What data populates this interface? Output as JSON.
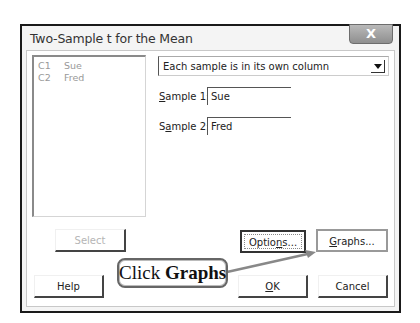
{
  "dialog": {
    "title": "Two-Sample t for the Mean",
    "close_label": "X"
  },
  "variables_list": {
    "items": [
      {
        "id": "C1",
        "name": "Sue"
      },
      {
        "id": "C2",
        "name": "Fred"
      }
    ]
  },
  "data_arrangement": {
    "selected": "Each sample is in its own column"
  },
  "sample1": {
    "label_prefix": "",
    "label_mnemonic": "S",
    "label_rest": "ample 1:",
    "value": "Sue"
  },
  "sample2": {
    "label_prefix": "S",
    "label_mnemonic": "a",
    "label_rest": "mple 2:",
    "value": "Fred"
  },
  "buttons": {
    "select": "Select",
    "options_pre": "Optio",
    "options_mnemonic": "n",
    "options_post": "s...",
    "graphs_mnemonic": "G",
    "graphs_post": "raphs...",
    "help": "Help",
    "ok_mnemonic": "O",
    "ok_post": "K",
    "cancel": "Cancel"
  },
  "annotation": {
    "prefix": "Click ",
    "emphasis": "Graphs"
  }
}
